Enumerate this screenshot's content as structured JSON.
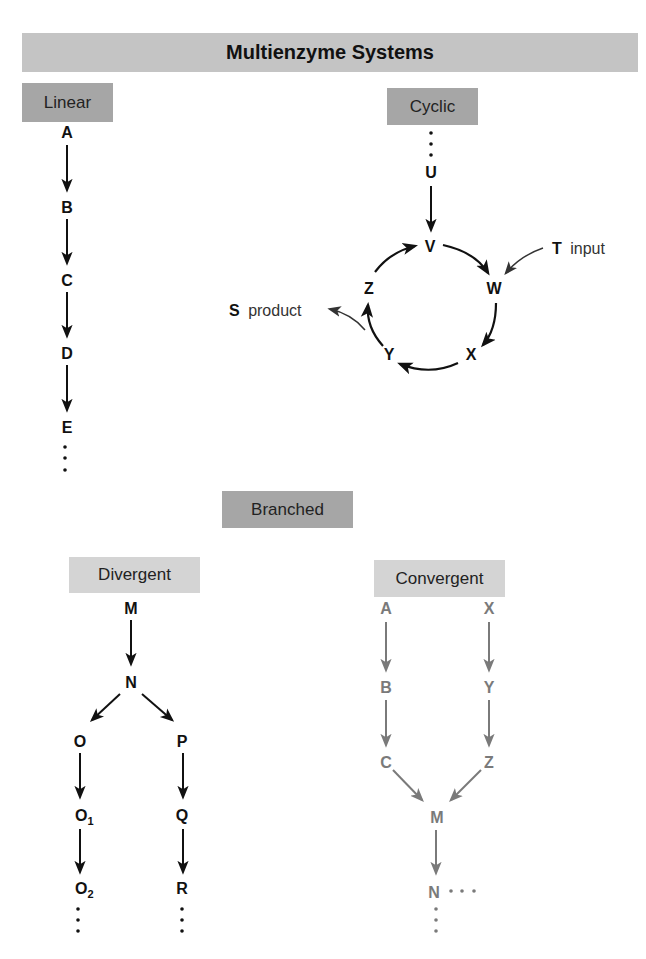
{
  "title": "Multienzyme Systems",
  "sections": {
    "linear": {
      "label": "Linear",
      "nodes": [
        "A",
        "B",
        "C",
        "D",
        "E"
      ],
      "continuation": "⋮"
    },
    "cyclic": {
      "label": "Cyclic",
      "entry_node": "U",
      "ring_nodes": [
        "V",
        "W",
        "X",
        "Y",
        "Z"
      ],
      "input": {
        "node": "T",
        "label": "input"
      },
      "output": {
        "node": "S",
        "label": "product"
      }
    },
    "branched": {
      "label": "Branched",
      "divergent": {
        "label": "Divergent",
        "nodes": {
          "m": "M",
          "n": "N",
          "o": "O",
          "o1": "O",
          "o1_sub": "1",
          "o2": "O",
          "o2_sub": "2",
          "p": "P",
          "q": "Q",
          "r": "R"
        }
      },
      "convergent": {
        "label": "Convergent",
        "nodes": {
          "a": "A",
          "b": "B",
          "c": "C",
          "x": "X",
          "y": "Y",
          "z": "Z",
          "m": "M",
          "n": "N"
        }
      }
    }
  },
  "colors": {
    "title_bg": "#c4c4c4",
    "dark_box": "#a6a6a6",
    "light_box": "#d4d4d4",
    "ink": "#111111",
    "convergent_ink": "#7a7a7a"
  }
}
